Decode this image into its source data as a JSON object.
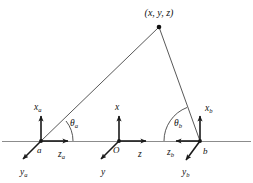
{
  "figure": {
    "background_color": "#ffffff",
    "line_color": "#1a1a1a",
    "baseline_color": "#8c8c8c",
    "ray_color": "#3a3a3a"
  },
  "target_point": {
    "label": "(x, y, z)",
    "x": 159,
    "y": 27
  },
  "frames": {
    "a": {
      "origin_label": "a",
      "x_axis_label": "x",
      "x_axis_subscript": "a",
      "y_axis_label": "y",
      "y_axis_subscript": "a",
      "z_axis_label": "z",
      "z_axis_subscript": "a",
      "angle_label": "θ",
      "angle_subscript": "a",
      "origin_x": 41,
      "origin_y": 141,
      "angle_degrees": 38
    },
    "o": {
      "origin_label": "O",
      "x_axis_label": "x",
      "y_axis_label": "y",
      "z_axis_label": "z",
      "origin_x": 119,
      "origin_y": 141
    },
    "b": {
      "origin_label": "b",
      "x_axis_label": "x",
      "x_axis_subscript": "b",
      "y_axis_label": "y",
      "y_axis_subscript": "b",
      "z_axis_label": "z",
      "z_axis_subscript": "b",
      "angle_label": "θ",
      "angle_subscript": "b",
      "origin_x": 200,
      "origin_y": 141,
      "angle_degrees": 105
    }
  }
}
